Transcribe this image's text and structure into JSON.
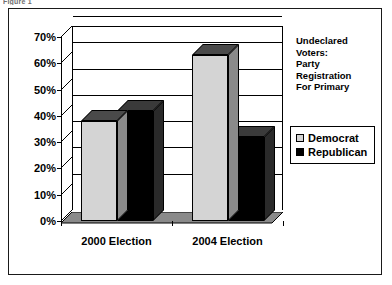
{
  "caption": "Figure 1",
  "title_lines": [
    "Undeclared",
    "Voters:",
    "Party",
    "Registration",
    "For Primary"
  ],
  "legend": {
    "items": [
      {
        "label": "Democrat",
        "color": "#d4d4d4"
      },
      {
        "label": "Republican",
        "color": "#000000"
      }
    ]
  },
  "chart_data": {
    "type": "bar",
    "xlabel": "",
    "ylabel": "",
    "categories": [
      "2000 Election",
      "2004 Election"
    ],
    "series": [
      {
        "name": "Democrat",
        "color": "#d4d4d4",
        "values": [
          38,
          63
        ]
      },
      {
        "name": "Republican",
        "color": "#000000",
        "values": [
          42,
          32
        ]
      }
    ],
    "ylim": [
      0,
      70
    ],
    "ytick_values": [
      0,
      10,
      20,
      30,
      40,
      50,
      60,
      70
    ],
    "ytick_labels": [
      "0%",
      "10%",
      "20%",
      "30%",
      "40%",
      "50%",
      "60%",
      "70%"
    ],
    "grid": true,
    "legend_position": "right",
    "three_d": true
  }
}
